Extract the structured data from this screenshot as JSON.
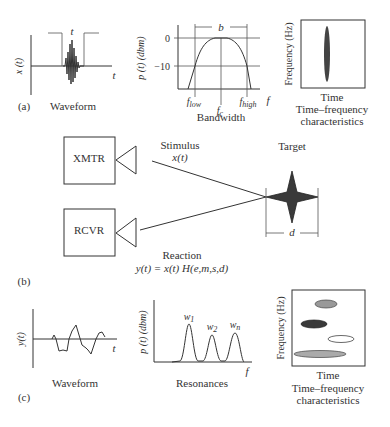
{
  "panel_a": {
    "label": "(a)",
    "waveform": {
      "caption": "Waveform",
      "ylabel": "x (t)",
      "xlabel": "t",
      "pulse_label": "t"
    },
    "bandwidth": {
      "caption": "Bandwidth",
      "ylabel": "p (t) (dbm)",
      "xlabel": "f",
      "tick_0": "0",
      "tick_m10": "−10",
      "b_label": "b",
      "f_low": "flow",
      "f_c": "fc",
      "f_high": "fhigh"
    },
    "tf": {
      "ylabel": "Frequency (Hz)",
      "xlabel": "Time",
      "caption_line1": "Time–frequency",
      "caption_line2": "characteristics"
    }
  },
  "panel_b": {
    "label": "(b)",
    "xmtr": "XMTR",
    "rcvr": "RCVR",
    "stimulus": "Stimulus",
    "stimulus_eq": "x(t)",
    "target": "Target",
    "d_label": "d",
    "reaction": "Reaction",
    "reaction_eq": "y(t) = x(t) H(e,m,s,d)"
  },
  "panel_c": {
    "label": "(c)",
    "waveform": {
      "caption": "Waveform",
      "ylabel": "y(t)",
      "xlabel": "t"
    },
    "resonances": {
      "caption": "Resonances",
      "ylabel": "p (t) (dbm)",
      "xlabel": "f",
      "w1": "w1",
      "w2": "w2",
      "wn": "wn"
    },
    "tf": {
      "ylabel": "Frequency (Hz)",
      "xlabel": "Time",
      "caption_line1": "Time–frequency",
      "caption_line2": "characteristics"
    }
  }
}
